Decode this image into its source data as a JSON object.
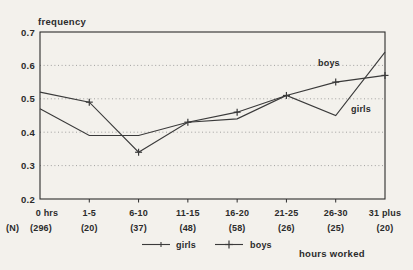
{
  "chart_data": {
    "type": "line",
    "title": "",
    "ylabel": "frequency",
    "xlabel": "hours worked",
    "categories": [
      "0 hrs",
      "1-5",
      "6-10",
      "11-15",
      "16-20",
      "21-25",
      "26-30",
      "31 plus"
    ],
    "n_row_prefix": "(N)",
    "n_values": [
      "(296)",
      "(20)",
      "(37)",
      "(48)",
      "(58)",
      "(26)",
      "(25)",
      "(20)"
    ],
    "ylim": [
      0.2,
      0.7
    ],
    "yticks": [
      0.2,
      0.3,
      0.4,
      0.5,
      0.6,
      0.7
    ],
    "gridline_values": [
      0.3,
      0.4,
      0.5,
      0.6
    ],
    "grid": "horizontal-dotted",
    "legend_position": "bottom",
    "series": [
      {
        "name": "girls",
        "marker": "none",
        "values": [
          0.47,
          0.39,
          0.39,
          0.43,
          0.44,
          0.51,
          0.45,
          0.64
        ]
      },
      {
        "name": "boys",
        "marker": "plus",
        "values": [
          0.52,
          0.49,
          0.34,
          0.43,
          0.46,
          0.51,
          0.55,
          0.57
        ]
      }
    ],
    "inline_labels": [
      {
        "text": "boys"
      },
      {
        "text": "girls"
      }
    ],
    "colors": {
      "line": "#3a3a3a",
      "grid": "#8d8d8d",
      "axis": "#2d2d2d",
      "text": "#2b2b2b",
      "background": "#f3f1ec"
    }
  }
}
